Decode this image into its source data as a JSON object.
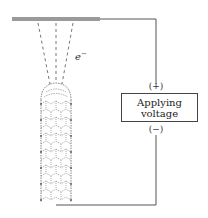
{
  "diagram": {
    "type": "field-emission-setup",
    "electron_label": "e",
    "electron_charge": "−",
    "positive_terminal": "(+)",
    "negative_terminal": "(−)",
    "power_box": {
      "line1": "Applying",
      "line2": "voltage"
    },
    "components": [
      "anode-plate",
      "electron-beams",
      "carbon-nanotube-emitter",
      "voltage-source",
      "circuit-wires"
    ],
    "colors": {
      "plate": "#9a9a9a",
      "wire": "#555555",
      "nanotube": "#666666",
      "dashed_beam": "#777777"
    }
  }
}
